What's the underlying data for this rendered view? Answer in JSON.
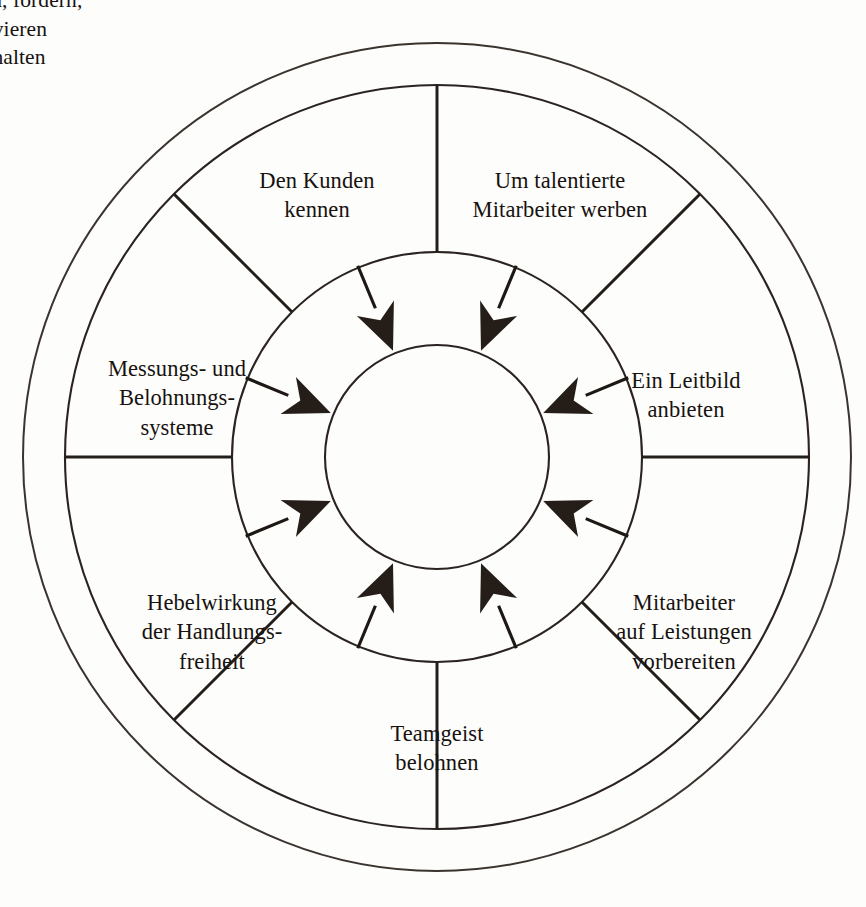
{
  "diagram": {
    "title": "Qualifizierte Mitarbeiter anwerben, fördern, motivieren und halten",
    "type": "radial-wheel",
    "center_label": "Qualifizierte\nMitarbeiter\nanwerben, fördern,\nmotivieren\nund halten",
    "colors": {
      "background": "#fdfdfc",
      "line": "#2a2320",
      "arrow": "#241d18",
      "text": "#17120f"
    },
    "geometry": {
      "center_x": 437,
      "center_y": 457,
      "radius_outer": 414,
      "radius_ring_inner": 372,
      "radius_middle": 205,
      "radius_core": 112,
      "sector_count": 8
    },
    "sectors": [
      {
        "id": "um-talentierte-mitarbeiter-werben",
        "label": "Um talentierte\nMitarbeiter werben",
        "angle_deg": -67.5,
        "label_x": 560,
        "label_y": 195
      },
      {
        "id": "ein-leitbild-anbieten",
        "label": "Ein Leitbild\nanbieten",
        "angle_deg": -22.5,
        "label_x": 686,
        "label_y": 395
      },
      {
        "id": "mitarbeiter-auf-leistungen-vorbereiten",
        "label": "Mitarbeiter\nauf Leistungen\nvorbereiten",
        "angle_deg": 22.5,
        "label_x": 684,
        "label_y": 632
      },
      {
        "id": "teamgeist-belohnen",
        "label": "Teamgeist\nbelohnen",
        "angle_deg": 67.5,
        "label_x": 437,
        "label_y": 748
      },
      {
        "id": "hebelwirkung-der-handlungsfreiheit",
        "label": "Hebelwirkung\nder Handlungs-\nfreiheit",
        "angle_deg": 112.5,
        "label_x": 212,
        "label_y": 632
      },
      {
        "id": "messungs-und-belohnungssysteme",
        "label": "Messungs- und\nBelohnungs-\nsysteme",
        "angle_deg": 157.5,
        "label_x": 177,
        "label_y": 398
      },
      {
        "id": "den-kunden-kennen",
        "label": "Den Kunden\nkennen",
        "angle_deg": -157.5,
        "label_x": 317,
        "label_y": 195
      },
      {
        "id": "spoke-top",
        "label": "",
        "angle_deg": -112.5,
        "label_x": 0,
        "label_y": 0
      }
    ]
  }
}
